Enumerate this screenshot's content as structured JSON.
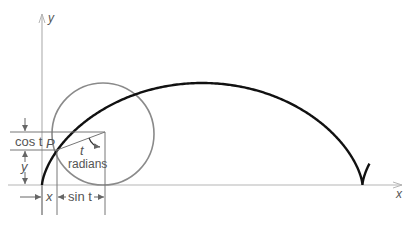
{
  "figure": {
    "axes": {
      "x_label": "x",
      "y_label": "y"
    },
    "point_label": "P",
    "angle_label": {
      "var": "t",
      "unit": "radians"
    },
    "dimension_labels": {
      "cos": "cos t",
      "y": "y",
      "x": "x",
      "sin": "sin t"
    }
  },
  "colors": {
    "curve": "#111111",
    "circle": "#8a8a8a",
    "axes": "#b5b5b5",
    "guides": "#777777",
    "text": "#555555"
  }
}
